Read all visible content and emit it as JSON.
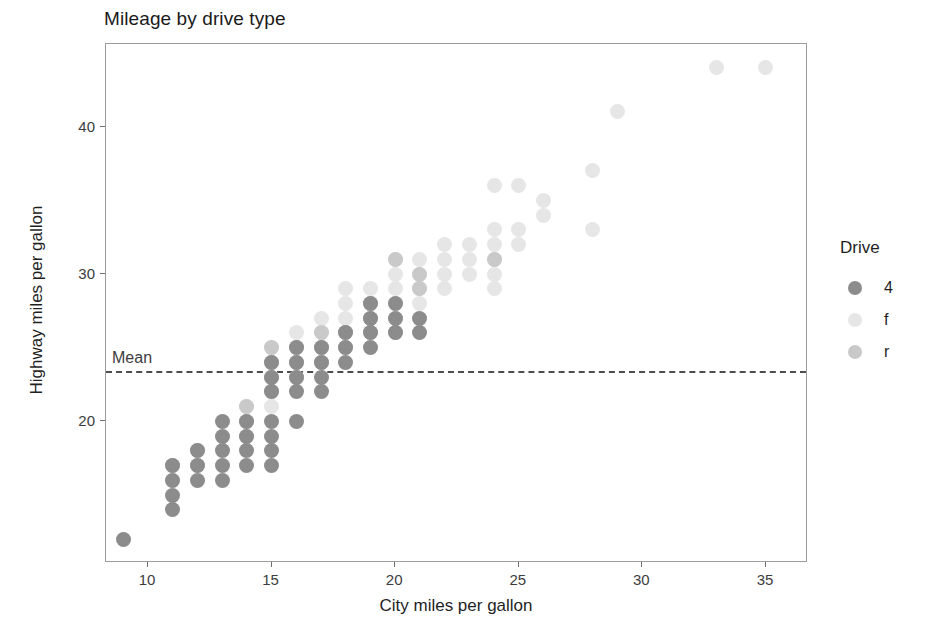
{
  "chart_data": {
    "type": "scatter",
    "title": "Mileage by drive type",
    "xlabel": "City miles per gallon",
    "ylabel": "Highway miles per gallon",
    "xlim": [
      8.3,
      36.7
    ],
    "ylim": [
      10.4,
      45.6
    ],
    "xticks": [
      10,
      15,
      20,
      25,
      30,
      35
    ],
    "yticks": [
      20,
      30,
      40
    ],
    "grid": false,
    "legend": {
      "title": "Drive",
      "position": "right",
      "entries": [
        {
          "label": "4",
          "color": "#8c8c8c"
        },
        {
          "label": "f",
          "color": "#e6e6e6"
        },
        {
          "label": "r",
          "color": "#c9c9c9"
        }
      ]
    },
    "annotations": [
      {
        "type": "hline",
        "label": "Mean",
        "y": 23.44,
        "style": "dashed",
        "color": "#4d4d4d"
      }
    ],
    "series": [
      {
        "name": "4",
        "color": "#8c8c8c",
        "points": [
          [
            9,
            12
          ],
          [
            11,
            14
          ],
          [
            11,
            15
          ],
          [
            11,
            16
          ],
          [
            11,
            17
          ],
          [
            12,
            16
          ],
          [
            12,
            17
          ],
          [
            12,
            18
          ],
          [
            13,
            16
          ],
          [
            13,
            17
          ],
          [
            13,
            18
          ],
          [
            13,
            19
          ],
          [
            13,
            20
          ],
          [
            14,
            17
          ],
          [
            14,
            18
          ],
          [
            14,
            19
          ],
          [
            14,
            20
          ],
          [
            15,
            17
          ],
          [
            15,
            18
          ],
          [
            15,
            19
          ],
          [
            15,
            20
          ],
          [
            15,
            22
          ],
          [
            15,
            23
          ],
          [
            15,
            24
          ],
          [
            16,
            20
          ],
          [
            16,
            22
          ],
          [
            16,
            23
          ],
          [
            16,
            24
          ],
          [
            16,
            25
          ],
          [
            17,
            22
          ],
          [
            17,
            23
          ],
          [
            17,
            24
          ],
          [
            17,
            25
          ],
          [
            18,
            24
          ],
          [
            18,
            25
          ],
          [
            18,
            26
          ],
          [
            19,
            25
          ],
          [
            19,
            26
          ],
          [
            19,
            27
          ],
          [
            19,
            28
          ],
          [
            20,
            26
          ],
          [
            20,
            27
          ],
          [
            20,
            28
          ],
          [
            21,
            26
          ],
          [
            21,
            27
          ]
        ]
      },
      {
        "name": "f",
        "color": "#e6e6e6",
        "points": [
          [
            11,
            16
          ],
          [
            11,
            17
          ],
          [
            14,
            20
          ],
          [
            14,
            21
          ],
          [
            15,
            21
          ],
          [
            15,
            22
          ],
          [
            15,
            23
          ],
          [
            15,
            24
          ],
          [
            15,
            25
          ],
          [
            16,
            23
          ],
          [
            16,
            24
          ],
          [
            16,
            25
          ],
          [
            16,
            26
          ],
          [
            17,
            24
          ],
          [
            17,
            25
          ],
          [
            17,
            26
          ],
          [
            17,
            27
          ],
          [
            18,
            25
          ],
          [
            18,
            26
          ],
          [
            18,
            27
          ],
          [
            18,
            28
          ],
          [
            18,
            29
          ],
          [
            19,
            26
          ],
          [
            19,
            27
          ],
          [
            19,
            28
          ],
          [
            19,
            29
          ],
          [
            20,
            27
          ],
          [
            20,
            28
          ],
          [
            20,
            29
          ],
          [
            20,
            30
          ],
          [
            20,
            31
          ],
          [
            21,
            28
          ],
          [
            21,
            29
          ],
          [
            21,
            30
          ],
          [
            21,
            31
          ],
          [
            22,
            29
          ],
          [
            22,
            30
          ],
          [
            22,
            31
          ],
          [
            22,
            32
          ],
          [
            23,
            30
          ],
          [
            23,
            31
          ],
          [
            23,
            32
          ],
          [
            24,
            29
          ],
          [
            24,
            30
          ],
          [
            24,
            31
          ],
          [
            24,
            32
          ],
          [
            24,
            33
          ],
          [
            24,
            36
          ],
          [
            25,
            32
          ],
          [
            25,
            33
          ],
          [
            25,
            36
          ],
          [
            26,
            34
          ],
          [
            26,
            35
          ],
          [
            28,
            33
          ],
          [
            28,
            37
          ],
          [
            29,
            41
          ],
          [
            33,
            44
          ],
          [
            35,
            44
          ]
        ]
      },
      {
        "name": "r",
        "color": "#c9c9c9",
        "points": [
          [
            11,
            17
          ],
          [
            12,
            17
          ],
          [
            12,
            18
          ],
          [
            14,
            19
          ],
          [
            14,
            20
          ],
          [
            14,
            21
          ],
          [
            15,
            22
          ],
          [
            15,
            23
          ],
          [
            15,
            24
          ],
          [
            15,
            25
          ],
          [
            16,
            23
          ],
          [
            16,
            24
          ],
          [
            16,
            25
          ],
          [
            17,
            24
          ],
          [
            17,
            25
          ],
          [
            17,
            26
          ],
          [
            18,
            25
          ],
          [
            18,
            26
          ],
          [
            19,
            26
          ],
          [
            19,
            27
          ],
          [
            19,
            28
          ],
          [
            20,
            26
          ],
          [
            20,
            31
          ],
          [
            21,
            29
          ],
          [
            21,
            30
          ],
          [
            24,
            31
          ]
        ]
      }
    ]
  },
  "axis": {
    "x_tick_labels": [
      "10",
      "15",
      "20",
      "25",
      "30",
      "35"
    ],
    "y_tick_labels": [
      "20",
      "30",
      "40"
    ]
  }
}
